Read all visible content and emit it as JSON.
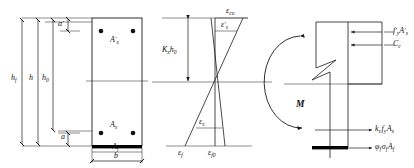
{
  "figure": {
    "ink_color": "#1a1a1a",
    "frp_color": "#000000"
  },
  "panel_section": {
    "name": "cross-section",
    "dimensions": [
      {
        "id": "hf",
        "base": "h",
        "sub": "f",
        "prime": ""
      },
      {
        "id": "h",
        "base": "h",
        "sub": "",
        "prime": ""
      },
      {
        "id": "h0",
        "base": "h",
        "sub": "0",
        "prime": ""
      },
      {
        "id": "a_top",
        "base": "a",
        "sub": "",
        "prime": "′"
      },
      {
        "id": "a_bot",
        "base": "a",
        "sub": "",
        "prime": ""
      },
      {
        "id": "b",
        "base": "b",
        "sub": "",
        "prime": ""
      }
    ],
    "rebar_labels": [
      {
        "id": "As_top",
        "base": "A",
        "sub": "s",
        "prime": "′"
      },
      {
        "id": "As_bot",
        "base": "A",
        "sub": "s",
        "prime": ""
      },
      {
        "id": "Af",
        "base": "A",
        "sub": "f",
        "prime": ""
      }
    ],
    "bar_count_top": 2,
    "bar_count_bottom": 2
  },
  "panel_strain": {
    "name": "strain-distribution",
    "neutral_axis_label": {
      "base": "K",
      "sub": "x",
      "tail": "h",
      "tail_sub": "0"
    },
    "strains": [
      {
        "id": "ecu",
        "glyph": "ε",
        "sub": "cu",
        "prime": ""
      },
      {
        "id": "es_prime",
        "glyph": "ε",
        "sub": "s",
        "prime": "′"
      },
      {
        "id": "es",
        "glyph": "ε",
        "sub": "s",
        "prime": ""
      },
      {
        "id": "ef",
        "glyph": "ε",
        "sub": "f",
        "prime": ""
      },
      {
        "id": "ef0",
        "glyph": "ε",
        "sub": "f0",
        "prime": ""
      }
    ]
  },
  "panel_forces": {
    "name": "force-resultants",
    "moment": {
      "id": "M",
      "label": "M"
    },
    "forces": [
      {
        "id": "fy_As_prime",
        "text_parts": [
          {
            "g": "f",
            "sub": "y",
            "pr": "′"
          },
          {
            "g": "A",
            "sub": "s",
            "pr": "′"
          }
        ]
      },
      {
        "id": "Cc",
        "text_parts": [
          {
            "g": "C",
            "sub": "c",
            "pr": ""
          }
        ]
      },
      {
        "id": "ks_fy_As",
        "text_parts": [
          {
            "g": "k",
            "sub": "s",
            "pr": ""
          },
          {
            "g": "f",
            "sub": "y",
            "pr": ""
          },
          {
            "g": "A",
            "sub": "s",
            "pr": ""
          }
        ]
      },
      {
        "id": "phif_sigmaf_Af",
        "text_parts": [
          {
            "g": "φ",
            "sub": "f",
            "pr": ""
          },
          {
            "g": "σ",
            "sub": "f",
            "pr": ""
          },
          {
            "g": "A",
            "sub": "f",
            "pr": ""
          }
        ]
      }
    ]
  }
}
